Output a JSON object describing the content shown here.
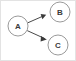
{
  "figure": {
    "kind": "directed-graph",
    "width": 76,
    "height": 61,
    "background_color": "#ffffff",
    "frame_color": "#e3e3e3",
    "node_fill": "#ffffff",
    "node_stroke": "#9a9a9a",
    "label_color": "#3a3a3a",
    "edge_color": "#4a4a4a"
  },
  "nodes": [
    {
      "id": "A",
      "label": "A",
      "cx": 18,
      "cy": 26,
      "r": 10.5
    },
    {
      "id": "B",
      "label": "B",
      "cx": 60,
      "cy": 12,
      "r": 10.5
    },
    {
      "id": "C",
      "label": "C",
      "cx": 58,
      "cy": 45,
      "r": 10.5
    }
  ],
  "edges": [
    {
      "id": "A-B",
      "from": "A",
      "to": "B",
      "directed": true,
      "x1": 27.8,
      "y1": 22.8,
      "x2": 45.6,
      "y2": 15.0,
      "head_points": "45.6,15.0 40.9,14.6 42.1,18.8"
    },
    {
      "id": "A-C",
      "from": "A",
      "to": "C",
      "directed": true,
      "x1": 27.2,
      "y1": 30.6,
      "x2": 46.3,
      "y2": 39.4,
      "head_points": "46.3,39.4 41.7,36.1 41.0,40.5"
    }
  ]
}
